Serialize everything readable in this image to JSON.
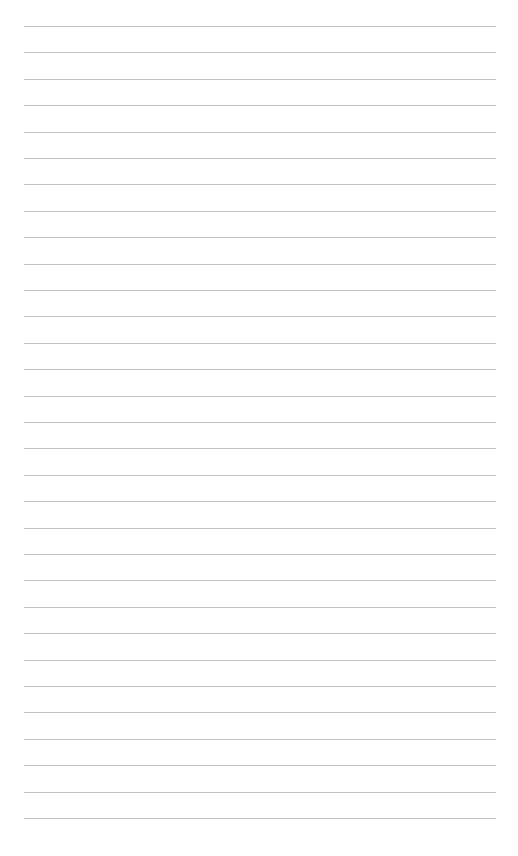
{
  "page": {
    "type": "lined-paper",
    "background_color": "#ffffff",
    "rule_color": "#b9b9b9",
    "rule_count": 31,
    "first_rule_y": 26,
    "rule_spacing": 26.4,
    "rule_left": 24,
    "rule_right": 496,
    "text_lines": []
  }
}
